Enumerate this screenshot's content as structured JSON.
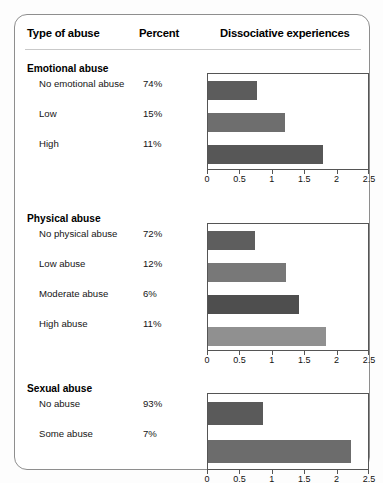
{
  "header": {
    "col_type": "Type of abuse",
    "col_percent": "Percent",
    "col_chart": "Dissociative experiences"
  },
  "axis": {
    "ticks": [
      "0",
      "0.5",
      "1",
      "1.5",
      "2",
      "2.5"
    ],
    "min": 0,
    "max": 2.5
  },
  "sections": [
    {
      "title": "Emotional abuse",
      "rows": [
        {
          "label": "No emotional abuse",
          "percent": "74%",
          "value": 0.76,
          "color": "#5c5c5c"
        },
        {
          "label": "Low",
          "percent": "15%",
          "value": 1.19,
          "color": "#6e6e6e"
        },
        {
          "label": "High",
          "percent": "11%",
          "value": 1.77,
          "color": "#575757"
        }
      ]
    },
    {
      "title": "Physical abuse",
      "rows": [
        {
          "label": "No physical abuse",
          "percent": "72%",
          "value": 0.73,
          "color": "#5e5e5e"
        },
        {
          "label": "Low abuse",
          "percent": "12%",
          "value": 1.2,
          "color": "#787878"
        },
        {
          "label": "Moderate abuse",
          "percent": "6%",
          "value": 1.4,
          "color": "#4e4e4e"
        },
        {
          "label": "High abuse",
          "percent": "11%",
          "value": 1.82,
          "color": "#909090"
        }
      ]
    },
    {
      "title": "Sexual abuse",
      "rows": [
        {
          "label": "No abuse",
          "percent": "93%",
          "value": 0.85,
          "color": "#5a5a5a"
        },
        {
          "label": "Some abuse",
          "percent": "7%",
          "value": 2.2,
          "color": "#6c6c6c"
        }
      ]
    }
  ],
  "chart_data": {
    "type": "bar",
    "title": "Dissociative experiences",
    "xlabel": "Dissociative experiences",
    "ylabel": "Type of abuse",
    "xlim": [
      0,
      2.5
    ],
    "grid": false,
    "legend": null,
    "orientation": "horizontal",
    "panels": [
      {
        "name": "Emotional abuse",
        "categories": [
          "No emotional abuse",
          "Low",
          "High"
        ],
        "values": [
          0.76,
          1.19,
          1.77
        ],
        "percents": [
          74,
          15,
          11
        ],
        "xticks": [
          0,
          0.5,
          1,
          1.5,
          2,
          2.5
        ]
      },
      {
        "name": "Physical abuse",
        "categories": [
          "No physical abuse",
          "Low abuse",
          "Moderate abuse",
          "High abuse"
        ],
        "values": [
          0.73,
          1.2,
          1.4,
          1.82
        ],
        "percents": [
          72,
          12,
          6,
          11
        ],
        "xticks": [
          0,
          0.5,
          1,
          1.5,
          2,
          2.5
        ]
      },
      {
        "name": "Sexual abuse",
        "categories": [
          "No abuse",
          "Some abuse"
        ],
        "values": [
          0.85,
          2.2
        ],
        "percents": [
          93,
          7
        ],
        "xticks": [
          0,
          0.5,
          1,
          1.5,
          2,
          2.5
        ]
      }
    ]
  },
  "layout": {
    "plot_left": 192,
    "plot_width": 162,
    "sections_top": [
      48,
      198,
      368
    ],
    "plot_tops": [
      10,
      10,
      10
    ],
    "plot_heights": [
      97,
      128,
      77
    ]
  }
}
